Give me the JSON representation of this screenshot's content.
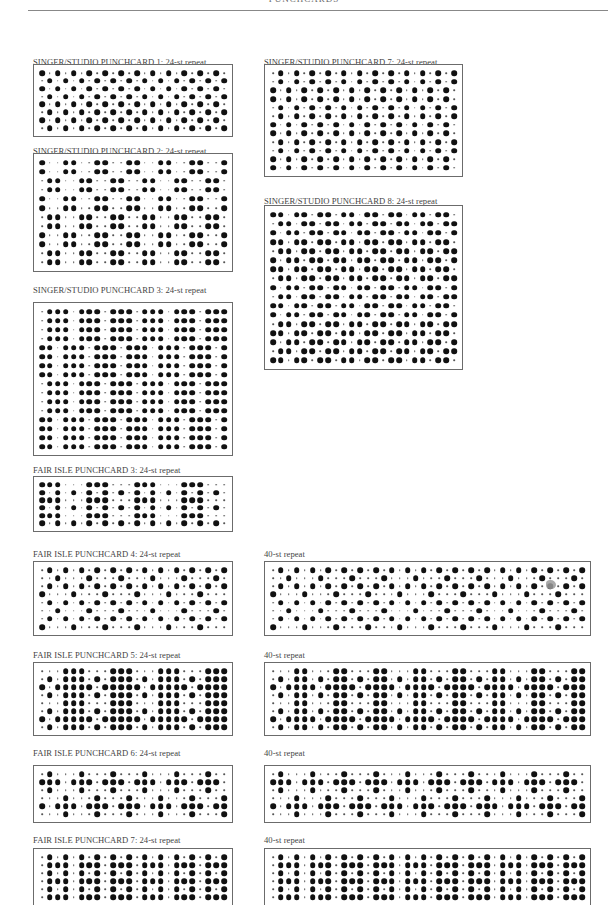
{
  "page": {
    "running_head": "PUNCHCARDS"
  },
  "cards": [
    {
      "id": "singer-1",
      "label": "SINGER/STUDIO PUNCHCARD 1: 24-st repeat",
      "label_pos": [
        33,
        57
      ],
      "box": [
        33,
        64,
        200,
        73
      ],
      "cols": 24,
      "rows": [
        "XO",
        "OX",
        "XO",
        "OX",
        "XO",
        "OX",
        "XO",
        "OX"
      ],
      "repeat_unit": 2
    },
    {
      "id": "singer-2",
      "label": "SINGER/STUDIO PUNCHCARD 2: 24-st repeat",
      "label_pos": [
        33,
        146
      ],
      "box": [
        33,
        153,
        200,
        119
      ],
      "cols": 24,
      "rows": [
        "XOOXXOOX",
        "XOOXXOOX",
        "OXXOOXXO",
        "OXXOOXXO",
        "XOOXXOOX",
        "XOOXXOOX",
        "OXXOOXXO",
        "OXXOOXXO",
        "XOOXXOOX",
        "XOOXXOOX",
        "OXXOOXXO",
        "OXXOOXXO"
      ],
      "repeat_unit": 8
    },
    {
      "id": "singer-3",
      "label": "SINGER/STUDIO PUNCHCARD 3: 24-st repeat",
      "label_pos": [
        33,
        285
      ],
      "box": [
        33,
        302,
        200,
        154
      ],
      "cols": 24,
      "rows": [
        "OXXX",
        "OXXX",
        "OXXX",
        "OXXX",
        "XXOX",
        "XXOX",
        "XXOX",
        "XXOX",
        "OXXX",
        "OXXX",
        "OXXX",
        "OXXX",
        "XXOX",
        "XXOX",
        "XXOX",
        "XXOX"
      ],
      "repeat_unit": 4
    },
    {
      "id": "fairisle-3",
      "label": "FAIR ISLE PUNCHCARD 3: 24-st repeat",
      "label_pos": [
        33,
        465
      ],
      "box": [
        33,
        476,
        200,
        56
      ],
      "cols": 24,
      "rows": [
        "XXXOOO",
        "XOXOXO",
        "XXXOOO",
        "XOXOXO",
        "XXXOOO",
        "XOXOXO"
      ],
      "repeat_unit": 6
    },
    {
      "id": "fairisle-4",
      "label": "FAIR ISLE PUNCHCARD 4: 24-st repeat",
      "label_pos": [
        33,
        549
      ],
      "box": [
        33,
        561,
        200,
        75
      ],
      "cols": 24,
      "rows": [
        "OX",
        "OOXO",
        "OX",
        "XOOO",
        "OX",
        "OOXO",
        "OX",
        "XOOO"
      ],
      "repeat_unit": 4
    },
    {
      "id": "fairisle-5",
      "label": "FAIR ISLE PUNCHCARD 5: 24-st repeat",
      "label_pos": [
        33,
        650
      ],
      "box": [
        33,
        662,
        200,
        74
      ],
      "cols": 24,
      "rows": [
        "OOOXXX",
        "OXOXXX",
        "XOXXXX",
        "OXOXXX",
        "OOOXXX",
        "OXOXXX",
        "XOXXXX",
        "OXOXXX"
      ],
      "repeat_unit": 6
    },
    {
      "id": "fairisle-6",
      "label": "FAIR ISLE PUNCHCARD 6: 24-st repeat",
      "label_pos": [
        33,
        748
      ],
      "box": [
        33,
        765,
        200,
        58
      ],
      "cols": 24,
      "rows": [
        "OXOO",
        "XXXO",
        "OXOO",
        "OOOX",
        "XOXX",
        "OOOX"
      ],
      "repeat_unit": 4
    },
    {
      "id": "fairisle-7",
      "label": "FAIR ISLE PUNCHCARD 7: 24-st repeat",
      "label_pos": [
        33,
        835
      ],
      "box": [
        33,
        848,
        200,
        58
      ],
      "cols": 24,
      "rows": [
        "OX",
        "OXXX",
        "OX",
        "OXXX",
        "OX",
        "OXXX"
      ],
      "repeat_unit": 4
    },
    {
      "id": "singer-7",
      "label": "SINGER/STUDIO PUNCHCARD 7: 24-st repeat",
      "label_pos": [
        264,
        57
      ],
      "box": [
        264,
        64,
        199,
        113
      ],
      "cols": 24,
      "rows": [
        "OX",
        "OX",
        "XO",
        "XO",
        "OX",
        "OX",
        "XO",
        "XO",
        "OX",
        "OX",
        "XO",
        "XO"
      ],
      "repeat_unit": 2
    },
    {
      "id": "singer-8",
      "label": "SINGER/STUDIO PUNCHCARD 8: 24-st repeat",
      "label_pos": [
        264,
        196
      ],
      "box": [
        264,
        205,
        199,
        165
      ],
      "cols": 24,
      "rows": [
        "XXO",
        "OXX",
        "XOX",
        "XXO",
        "OXX",
        "XOX",
        "XXO",
        "OXX",
        "XOX",
        "OXX",
        "XXO",
        "XOX",
        "OXX",
        "XXO",
        "XOX",
        "OXX",
        "XXO"
      ],
      "repeat_unit": 3
    },
    {
      "id": "forty-1",
      "label": "40-st repeat",
      "label_pos": [
        264,
        549
      ],
      "box": [
        264,
        561,
        327,
        75
      ],
      "cols": 40,
      "rows": [
        "OX",
        "OOXO",
        "OX",
        "XOOO",
        "OX",
        "OOXO",
        "OX",
        "XOOO"
      ],
      "repeat_unit": 4,
      "smudge": [
        550,
        584
      ]
    },
    {
      "id": "forty-2",
      "label": "40-st repeat",
      "label_pos": [
        264,
        650
      ],
      "box": [
        264,
        662,
        327,
        74
      ],
      "cols": 40,
      "rows": [
        "OOOXX",
        "OXOXX",
        "XOXXX",
        "OXOXX",
        "OOOXX",
        "OXOXX",
        "XOXXX",
        "OXOXX"
      ],
      "repeat_unit": 5
    },
    {
      "id": "forty-3",
      "label": "40-st repeat",
      "label_pos": [
        264,
        748
      ],
      "box": [
        264,
        765,
        327,
        58
      ],
      "cols": 40,
      "rows": [
        "OXOO",
        "XXXO",
        "OXOO",
        "OOOX",
        "XOXX",
        "OOOX"
      ],
      "repeat_unit": 4
    },
    {
      "id": "forty-4",
      "label": "40-st repeat",
      "label_pos": [
        264,
        835
      ],
      "box": [
        264,
        848,
        327,
        58
      ],
      "cols": 40,
      "rows": [
        "OX",
        "OXXX",
        "OX",
        "OXXX",
        "OX",
        "OXXX"
      ],
      "repeat_unit": 4
    }
  ],
  "legend": {
    "big_dot": "punched hole (contrast stitch)",
    "small_dot": "unpunched position"
  }
}
